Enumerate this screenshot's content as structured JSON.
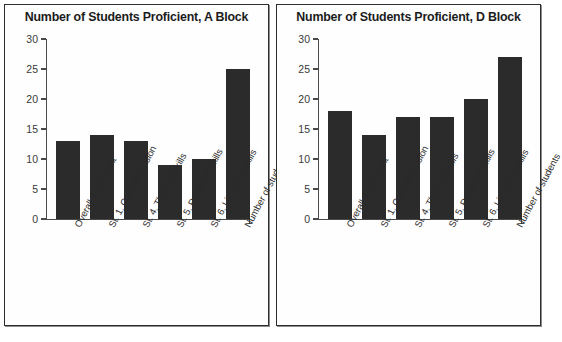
{
  "chart_data": [
    {
      "type": "bar",
      "title": "Number of Students Proficient, A Block",
      "categories": [
        "Overall # proficient",
        "St. 1. Comprehension",
        "St. 4. Thinking skills",
        "St. 5. Research skills",
        "St. 6. Literature skills",
        "Number of students"
      ],
      "values": [
        13,
        14,
        13,
        9,
        10,
        25
      ],
      "xlabel": "",
      "ylabel": "",
      "ylim": [
        0,
        30
      ],
      "yticks": [
        0,
        5,
        10,
        15,
        20,
        25,
        30
      ],
      "grid": false,
      "legend": false,
      "bar_color": "#2b2b2b"
    },
    {
      "type": "bar",
      "title": "Number of Students Proficient, D Block",
      "categories": [
        "Overall # proficient",
        "St. 1. Comprehension",
        "St. 4. Thinking skills",
        "St. 5. Research skills",
        "St. 6. Literature skills",
        "Number of students"
      ],
      "values": [
        18,
        14,
        17,
        17,
        20,
        27
      ],
      "xlabel": "",
      "ylabel": "",
      "ylim": [
        0,
        30
      ],
      "yticks": [
        0,
        5,
        10,
        15,
        20,
        25,
        30
      ],
      "grid": false,
      "legend": false,
      "bar_color": "#2b2b2b"
    }
  ]
}
